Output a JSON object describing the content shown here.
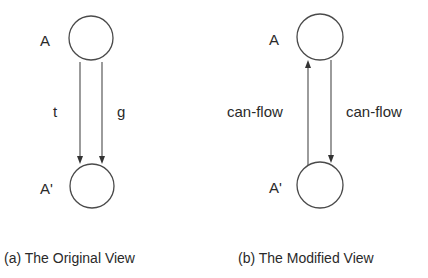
{
  "panels": [
    {
      "id": "original",
      "caption": "(a) The Original View",
      "nodes": [
        {
          "id": "A",
          "label": "A"
        },
        {
          "id": "A_prime",
          "label": "A'"
        }
      ],
      "edges": [
        {
          "from": "A",
          "to": "A_prime",
          "label": "t",
          "direction": "down"
        },
        {
          "from": "A",
          "to": "A_prime",
          "label": "g",
          "direction": "down"
        }
      ]
    },
    {
      "id": "modified",
      "caption": "(b) The Modified View",
      "nodes": [
        {
          "id": "A",
          "label": "A"
        },
        {
          "id": "A_prime",
          "label": "A'"
        }
      ],
      "edges": [
        {
          "from": "A_prime",
          "to": "A",
          "label": "can-flow",
          "direction": "up"
        },
        {
          "from": "A",
          "to": "A_prime",
          "label": "can-flow",
          "direction": "down"
        }
      ]
    }
  ]
}
